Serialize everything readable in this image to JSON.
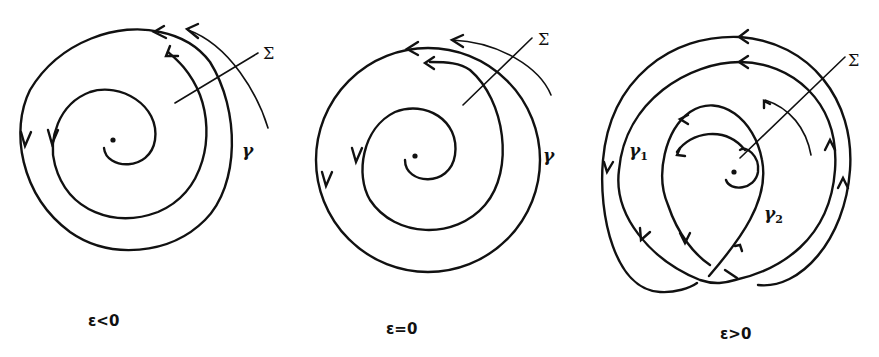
{
  "figure": {
    "panels": [
      {
        "id": "eps-neg",
        "caption": "ε<0",
        "section_label": "Σ",
        "orbit_label": "γ"
      },
      {
        "id": "eps-zero",
        "caption": "ε=0",
        "section_label": "Σ",
        "orbit_label": "γ"
      },
      {
        "id": "eps-pos",
        "caption": "ε>0",
        "section_label": "Σ",
        "orbit_label_1": "γ",
        "orbit_label_1_sub": "1",
        "orbit_label_2": "γ",
        "orbit_label_2_sub": "2"
      }
    ],
    "stroke_color": "#111111",
    "background": "#ffffff"
  }
}
